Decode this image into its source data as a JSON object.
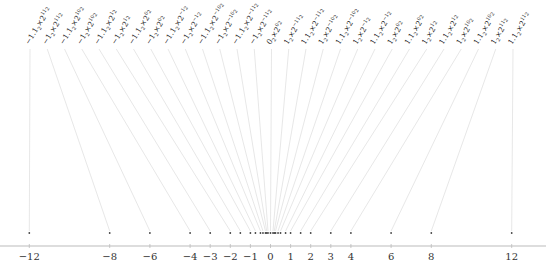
{
  "diagram": {
    "title": "",
    "axis": {
      "min": -12.5,
      "max": 13.5,
      "ticks": [
        -12,
        -8,
        -6,
        -4,
        -3,
        -2,
        -1,
        0,
        1,
        2,
        3,
        4,
        6,
        8,
        12
      ],
      "tick_labels": [
        "−12",
        "−8",
        "−6",
        "−4",
        "−3",
        "−2",
        "−1",
        "0",
        "1",
        "2",
        "3",
        "4",
        "6",
        "8",
        "12"
      ]
    },
    "colors": {
      "axis": "#bbbbbb",
      "connector": "#d6d6d6",
      "dot": "#444444",
      "text": "#222222"
    },
    "points": [
      {
        "sign": "−",
        "mant": "1.1",
        "exp": "11",
        "value": -12
      },
      {
        "sign": "−",
        "mant": "1",
        "exp": "11",
        "value": -8
      },
      {
        "sign": "−",
        "mant": "1.1",
        "exp": "10",
        "value": -6
      },
      {
        "sign": "−",
        "mant": "1",
        "exp": "10",
        "value": -4
      },
      {
        "sign": "−",
        "mant": "1.1",
        "exp": "1",
        "value": -3
      },
      {
        "sign": "−",
        "mant": "1",
        "exp": "1",
        "value": -2
      },
      {
        "sign": "−",
        "mant": "1.1",
        "exp": "0",
        "value": -1.5
      },
      {
        "sign": "−",
        "mant": "1",
        "exp": "0",
        "value": -1
      },
      {
        "sign": "−",
        "mant": "1.1",
        "exp": "−1",
        "value": -0.75
      },
      {
        "sign": "−",
        "mant": "1",
        "exp": "−1",
        "value": -0.5
      },
      {
        "sign": "−",
        "mant": "1.1",
        "exp": "−10",
        "value": -0.375
      },
      {
        "sign": "−",
        "mant": "1",
        "exp": "−10",
        "value": -0.25
      },
      {
        "sign": "−",
        "mant": "1.1",
        "exp": "−11",
        "value": -0.1875
      },
      {
        "sign": "−",
        "mant": "1",
        "exp": "−11",
        "value": -0.125
      },
      {
        "sign": "",
        "mant": "0",
        "exp": "0",
        "value": 0
      },
      {
        "sign": "",
        "mant": "1",
        "exp": "−11",
        "value": 0.125
      },
      {
        "sign": "",
        "mant": "1.1",
        "exp": "−11",
        "value": 0.1875
      },
      {
        "sign": "",
        "mant": "1",
        "exp": "−10",
        "value": 0.25
      },
      {
        "sign": "",
        "mant": "1.1",
        "exp": "−10",
        "value": 0.375
      },
      {
        "sign": "",
        "mant": "1",
        "exp": "−1",
        "value": 0.5
      },
      {
        "sign": "",
        "mant": "1.1",
        "exp": "−1",
        "value": 0.75
      },
      {
        "sign": "",
        "mant": "1",
        "exp": "0",
        "value": 1
      },
      {
        "sign": "",
        "mant": "1.1",
        "exp": "0",
        "value": 1.5
      },
      {
        "sign": "",
        "mant": "1",
        "exp": "1",
        "value": 2
      },
      {
        "sign": "",
        "mant": "1.1",
        "exp": "1",
        "value": 3
      },
      {
        "sign": "",
        "mant": "1",
        "exp": "10",
        "value": 4
      },
      {
        "sign": "",
        "mant": "1.1",
        "exp": "10",
        "value": 6
      },
      {
        "sign": "",
        "mant": "1",
        "exp": "11",
        "value": 8
      },
      {
        "sign": "",
        "mant": "1.1",
        "exp": "11",
        "value": 12
      }
    ],
    "base_subscript": "2",
    "times": "×",
    "radix": "2"
  }
}
